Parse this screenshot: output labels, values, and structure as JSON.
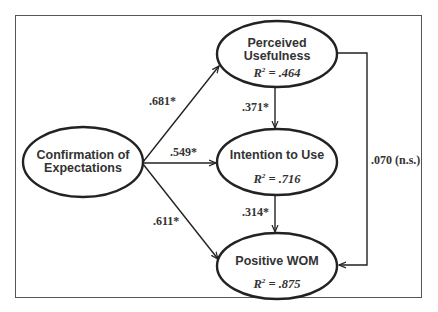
{
  "diagram": {
    "type": "path-model",
    "nodes": {
      "confirmation": {
        "line1": "Confirmation of",
        "line2": "Expectations"
      },
      "perceived_usefulness": {
        "line1": "Perceived",
        "line2": "Usefulness",
        "r2_label": "R",
        "r2_value": " = .464"
      },
      "intention": {
        "line1": "Intention to Use",
        "r2_label": "R",
        "r2_value": " = .716"
      },
      "wom": {
        "line1": "Positive WOM",
        "r2_label": "R",
        "r2_value": " = .875"
      }
    },
    "edges": {
      "conf_to_pu": ".681*",
      "conf_to_itu": ".549*",
      "conf_to_wom": ".611*",
      "pu_to_itu": ".371*",
      "itu_to_wom": ".314*",
      "pu_to_wom": ".070 (n.s.)"
    },
    "superscript": "2",
    "colors": {
      "stroke": "#222222",
      "text": "#333333",
      "frame": "#555555"
    }
  }
}
